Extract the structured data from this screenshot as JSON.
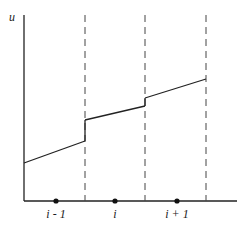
{
  "diagram": {
    "type": "piecewise-linear reconstruction over cells",
    "y_axis_label": "u",
    "node_labels": [
      "i - 1",
      "i",
      "i + 1"
    ],
    "colors": {
      "line": "#222222",
      "dash": "#444444",
      "background": "#ffffff"
    },
    "geometry": {
      "origin": [
        24,
        201
      ],
      "y_axis_top": 15,
      "x_axis_end": 237,
      "cell_interfaces_x": [
        85,
        145,
        206
      ],
      "node_x": [
        56,
        115,
        177
      ],
      "segments": [
        {
          "x1": 24,
          "y1": 163,
          "x2": 85,
          "y2": 141
        },
        {
          "x1": 85,
          "y1": 120,
          "x2": 145,
          "y2": 106
        },
        {
          "x1": 145,
          "y1": 98,
          "x2": 206,
          "y2": 79
        }
      ],
      "jumps": [
        {
          "x": 85,
          "y1": 141,
          "y2": 120
        },
        {
          "x": 145,
          "y1": 106,
          "y2": 98
        }
      ]
    }
  }
}
